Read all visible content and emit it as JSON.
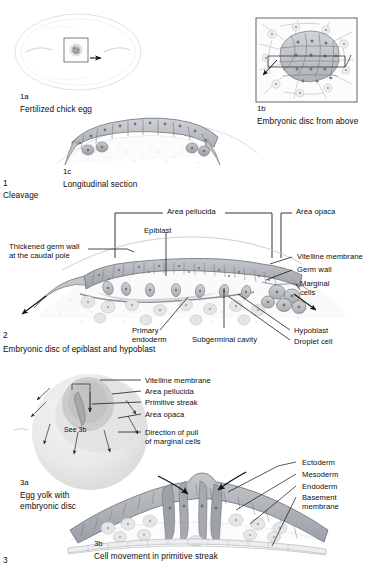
{
  "figure": {
    "title_implied": "Chick embryo development plate",
    "sections": [
      {
        "number": "1",
        "name": "Cleavage"
      },
      {
        "number": "2",
        "name": "Embryonic disc of epiblast and hypoblast"
      },
      {
        "number": "3",
        "name": "3"
      }
    ]
  },
  "panels": {
    "p1a": {
      "id": "1a",
      "caption": "Fertilized chick egg"
    },
    "p1b": {
      "id": "1b",
      "caption": "Embryonic disc from above"
    },
    "p1c": {
      "id": "1c",
      "caption": "Longitudinal section"
    },
    "p2": {
      "id": "2",
      "caption": "Embryonic disc of epiblast and hypoblast"
    },
    "p3a": {
      "id": "3a",
      "caption_line1": "Egg yolk with",
      "caption_line2": "embryonic disc"
    },
    "p3b": {
      "id": "3b",
      "caption": "Cell movement in primitive streak"
    },
    "sec1": {
      "id": "1",
      "caption": "Cleavage"
    },
    "sec3": {
      "id": "3"
    }
  },
  "labels_fig2": {
    "area_pellucida": "Area pellucida",
    "area_opaca": "Area opaca",
    "epiblast": "Epiblast",
    "thickened_germ_wall_l1": "Thickened germ wall",
    "thickened_germ_wall_l2": "at the caudal pole",
    "vitelline_membrane": "Vitelline membrane",
    "germ_wall": "Germ wall",
    "marginal_cells_l1": "Marginal",
    "marginal_cells_l2": "cells",
    "primary_endoderm_l1": "Primary",
    "primary_endoderm_l2": "endoderm",
    "subgerminal_cavity": "Subgerminal cavity",
    "hypoblast": "Hypoblast",
    "droplet_cell": "Droplet cell"
  },
  "labels_fig3a": {
    "vitelline_membrane": "Vitelline membrane",
    "area_pellucida": "Area pellucida",
    "primitive_streak": "Primitive streak",
    "area_opaca": "Area opaca",
    "direction_l1": "Direction of pull",
    "direction_l2": "of marginal cells",
    "see_3b": "See 3b"
  },
  "labels_fig3b": {
    "ectoderm": "Ectoderm",
    "mesoderm": "Mesoderm",
    "endoderm": "Endoderm",
    "basement_l1": "Basement",
    "basement_l2": "membrane"
  },
  "colors": {
    "ink": "#0d0d0d",
    "leader": "#111111",
    "cell_fill": "#b9bcc0",
    "cell_fill_light": "#d7d9dc",
    "cell_outline": "#6e7277",
    "yolk": "#ececec",
    "yolk_mid": "#dcdcdc",
    "yolk_dark": "#c9c9c9",
    "pale": "#f2f2f2",
    "background": "#ffffff"
  }
}
